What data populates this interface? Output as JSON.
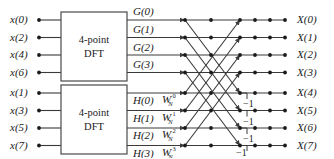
{
  "figure": {
    "type": "signal-flow-graph",
    "colors": {
      "background": "#ffffff",
      "line": "#3a3a3a",
      "node": "#1a1a1a",
      "text": "#1a1a1a",
      "box_stroke": "#4a4a4a"
    },
    "geometry": {
      "width": 334,
      "height": 158,
      "rows_y": [
        20,
        37.5,
        55,
        72.5,
        93,
        110.5,
        128,
        145.5
      ],
      "input_node_x": 39,
      "box_left_x": 61,
      "box_right_x": 127,
      "stage_in_x": 185,
      "stage_mid_x": 211,
      "stage_node_x": 240,
      "stage_b_x": 255,
      "stage_c_x": 270,
      "stage_out_x": 285
    }
  },
  "inputs": [
    {
      "label": "x(0)",
      "var": "x",
      "index": "(0)"
    },
    {
      "label": "x(2)",
      "var": "x",
      "index": "(2)"
    },
    {
      "label": "x(4)",
      "var": "x",
      "index": "(4)"
    },
    {
      "label": "x(6)",
      "var": "x",
      "index": "(6)"
    },
    {
      "label": "x(1)",
      "var": "x",
      "index": "(1)"
    },
    {
      "label": "x(3)",
      "var": "x",
      "index": "(3)"
    },
    {
      "label": "x(5)",
      "var": "x",
      "index": "(5)"
    },
    {
      "label": "x(7)",
      "var": "x",
      "index": "(7)"
    }
  ],
  "blocks": [
    {
      "name": "dft-top",
      "line1": "4-point",
      "line2": "DFT"
    },
    {
      "name": "dft-bottom",
      "line1": "4-point",
      "line2": "DFT"
    }
  ],
  "intermediate_top": [
    {
      "label": "G(0)",
      "var": "G",
      "index": "(0)"
    },
    {
      "label": "G(1)",
      "var": "G",
      "index": "(1)"
    },
    {
      "label": "G(2)",
      "var": "G",
      "index": "(2)"
    },
    {
      "label": "G(3)",
      "var": "G",
      "index": "(3)"
    }
  ],
  "intermediate_bottom": [
    {
      "label": "H(0)",
      "var": "H",
      "index": "(0)"
    },
    {
      "label": "H(1)",
      "var": "H",
      "index": "(1)"
    },
    {
      "label": "H(2)",
      "var": "H",
      "index": "(2)"
    },
    {
      "label": "H(3)",
      "var": "H",
      "index": "(3)"
    }
  ],
  "twiddles": [
    {
      "base": "W",
      "sub": "N",
      "sup": "0"
    },
    {
      "base": "W",
      "sub": "N",
      "sup": "1"
    },
    {
      "base": "W",
      "sub": "N",
      "sup": "2"
    },
    {
      "base": "W",
      "sub": "N",
      "sup": "3"
    }
  ],
  "minus_ones": [
    {
      "label": "−1",
      "row": 4
    },
    {
      "label": "−1",
      "row": 5
    },
    {
      "label": "−1",
      "row": 6
    },
    {
      "label": "−1",
      "row": 7
    }
  ],
  "outputs": [
    {
      "label": "X(0)",
      "var": "X",
      "index": "(0)"
    },
    {
      "label": "X(1)",
      "var": "X",
      "index": "(1)"
    },
    {
      "label": "X(2)",
      "var": "X",
      "index": "(2)"
    },
    {
      "label": "X(3)",
      "var": "X",
      "index": "(3)"
    },
    {
      "label": "X(4)",
      "var": "X",
      "index": "(4)"
    },
    {
      "label": "X(5)",
      "var": "X",
      "index": "(5)"
    },
    {
      "label": "X(6)",
      "var": "X",
      "index": "(6)"
    },
    {
      "label": "X(7)",
      "var": "X",
      "index": "(7)"
    }
  ]
}
